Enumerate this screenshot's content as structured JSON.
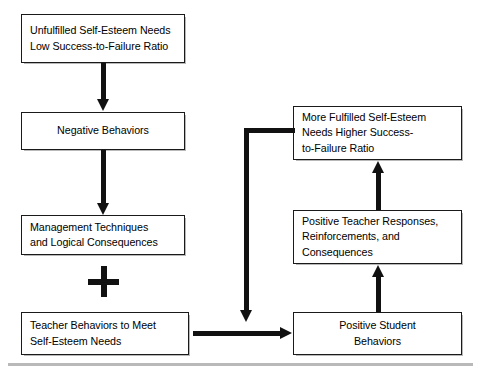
{
  "figure": {
    "nodes": {
      "unfulfilled": "Unfulfilled Self-Esteem Needs\nLow Success-to-Failure Ratio",
      "negative": "Negative Behaviors",
      "management": "Management Techniques\nand Logical Consequences",
      "teacher_behaviors": "Teacher Behaviors to Meet\nSelf-Esteem Needs",
      "more_fulfilled": "More Fulfilled Self-Esteem\nNeeds Higher Success-\nto-Failure Ratio",
      "teacher_responses": "Positive Teacher Responses,\nReinforcements, and\nConsequences",
      "student_behaviors": "Positive Student\nBehaviors"
    },
    "operators": {
      "plus": "+"
    },
    "colors": {
      "box_border": "#1a1a1a",
      "box_fill": "#ffffff",
      "arrow": "#111111",
      "rule": "#b9b9b9",
      "text": "#000000"
    }
  }
}
